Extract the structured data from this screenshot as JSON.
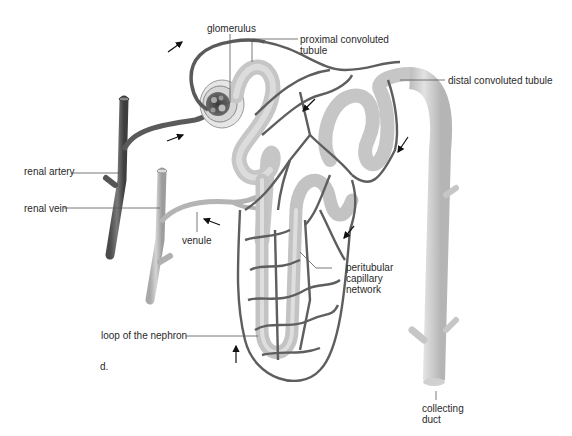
{
  "figure": {
    "panel_letter": "d.",
    "labels": {
      "glomerulus": "glomerulus",
      "proximal_convoluted_tubule": "proximal convoluted\ntubule",
      "distal_convoluted_tubule": "distal convoluted tubule",
      "renal_artery": "renal artery",
      "renal_vein": "renal vein",
      "venule": "venule",
      "peritubular_capillary_network": "peritubular\ncapillary\nnetwork",
      "loop_of_the_nephron": "loop of the nephron",
      "collecting_duct": "collecting\nduct"
    },
    "colors": {
      "artery": "#5a5a5a",
      "vein": "#b0b0b0",
      "tubule": "#c8c8c8",
      "capillary": "#5e5e5e",
      "leader_line": "#555555",
      "label_text": "#2a2a2a"
    },
    "flow_arrows": [
      {
        "x": 175,
        "y": 45,
        "direction": "up-right"
      },
      {
        "x": 177,
        "y": 136,
        "direction": "right"
      },
      {
        "x": 306,
        "y": 106,
        "direction": "down-left"
      },
      {
        "x": 398,
        "y": 146,
        "direction": "down-left"
      },
      {
        "x": 346,
        "y": 232,
        "direction": "down-left"
      },
      {
        "x": 210,
        "y": 222,
        "direction": "left"
      },
      {
        "x": 236,
        "y": 350,
        "direction": "up"
      }
    ]
  }
}
